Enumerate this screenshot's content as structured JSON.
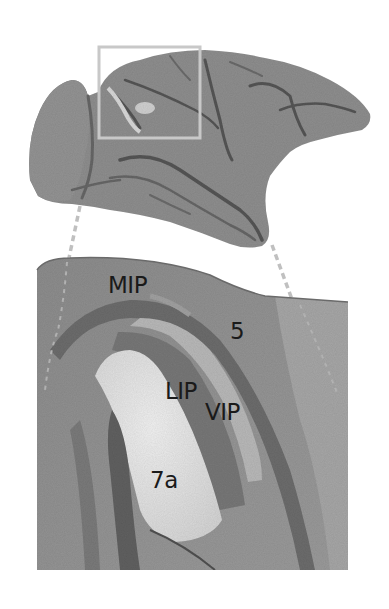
{
  "figure": {
    "whole_brain": {
      "view": "lateral",
      "highlight_box": {
        "x": 99,
        "y": 46,
        "width": 102,
        "height": 93,
        "color": "#c8c8c8"
      }
    },
    "inset": {
      "x": 37,
      "y": 258,
      "width": 311,
      "height": 312
    },
    "connector_lines": {
      "style": "dashed",
      "color": "#c0c0c0"
    },
    "areas": [
      {
        "id": "MIP",
        "label": "MIP"
      },
      {
        "id": "5",
        "label": "5"
      },
      {
        "id": "LIP",
        "label": "LIP"
      },
      {
        "id": "VIP",
        "label": "VIP"
      },
      {
        "id": "7a",
        "label": "7a"
      }
    ],
    "colors": {
      "cortex": "#8a8a8a",
      "cortex_dark": "#5e5e5e",
      "area_light": "#e6e6e6",
      "area_mid": "#a8a8a8",
      "label_text": "#1a1a1a",
      "background": "#ffffff"
    }
  }
}
